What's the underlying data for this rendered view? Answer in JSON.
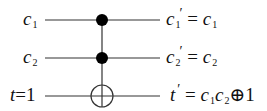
{
  "diagram": {
    "type": "quantum-circuit",
    "gate": "Toffoli (CCNOT)",
    "inputs": [
      {
        "var": "c",
        "sub": "1",
        "suffix": ""
      },
      {
        "var": "c",
        "sub": "2",
        "suffix": ""
      },
      {
        "var": "t",
        "sub": "",
        "suffix": "=1"
      }
    ],
    "outputs": [
      {
        "lhs_var": "c",
        "lhs_sub": "1",
        "prime": "′",
        "eq": " = ",
        "rhs": [
          {
            "var": "c",
            "sub": "1"
          }
        ],
        "tail": ""
      },
      {
        "lhs_var": "c",
        "lhs_sub": "2",
        "prime": "′",
        "eq": " = ",
        "rhs": [
          {
            "var": "c",
            "sub": "2"
          }
        ],
        "tail": ""
      },
      {
        "lhs_var": "t",
        "lhs_sub": "",
        "prime": "′",
        "eq": " = ",
        "rhs": [
          {
            "var": "c",
            "sub": "1"
          },
          {
            "var": "c",
            "sub": "2"
          }
        ],
        "tail": "⊕1"
      }
    ],
    "wires_y": [
      20,
      58,
      96
    ],
    "controls": [
      0,
      1
    ],
    "target": 2,
    "colors": {
      "line": "#333333",
      "ink": "#111111"
    }
  }
}
